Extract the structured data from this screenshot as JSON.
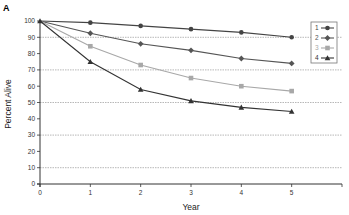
{
  "chart_data": {
    "type": "line",
    "panel_label": "A",
    "title": "",
    "xlabel": "Year",
    "ylabel": "Percent Alive",
    "x": [
      0,
      1,
      2,
      3,
      4,
      5
    ],
    "xlim": [
      0,
      6
    ],
    "ylim": [
      0,
      100
    ],
    "xticks": [
      "0",
      "1",
      "2",
      "3",
      "4",
      "5"
    ],
    "yticks": [
      "0",
      "10",
      "20",
      "30",
      "40",
      "50",
      "60",
      "70",
      "80",
      "90",
      "100"
    ],
    "gridlines_y": [
      10,
      30,
      50,
      70,
      90
    ],
    "grid": "horizontal-dotted",
    "legend_position": "top-right",
    "series": [
      {
        "name": "1",
        "values": [
          100,
          99,
          97,
          95,
          93,
          90
        ],
        "color": "#444444",
        "marker": "circle"
      },
      {
        "name": "2",
        "values": [
          100,
          92.5,
          86,
          82,
          77,
          74
        ],
        "color": "#555555",
        "marker": "diamond"
      },
      {
        "name": "3",
        "values": [
          100,
          84.5,
          73,
          65,
          60,
          57
        ],
        "color": "#a8a8a8",
        "marker": "square"
      },
      {
        "name": "4",
        "values": [
          100,
          75,
          58,
          51,
          47,
          44.5
        ],
        "color": "#333333",
        "marker": "triangle"
      }
    ]
  }
}
